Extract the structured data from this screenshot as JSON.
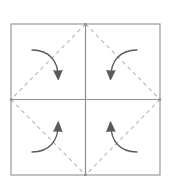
{
  "figure": {
    "name": "paper-folding-diagram",
    "title": "",
    "background_color": "#ffffff",
    "width": 172,
    "height": 185
  },
  "colors": {
    "square_outline": "#9a9a9a",
    "midline": "#8f8f8f",
    "dashed_diagonal": "#b5b5b5",
    "arrow": "#5a5a5a",
    "background": "#ffffff"
  },
  "square": {
    "name": "outer-square",
    "label": "",
    "left": 11,
    "top": 24,
    "right": 160,
    "bottom": 175,
    "stroke_width": 1.2
  },
  "midlines": {
    "horizontal": {
      "label": "",
      "x1": 11,
      "y1": 99.5,
      "x2": 160,
      "y2": 99.5
    },
    "vertical": {
      "label": "",
      "x1": 85.5,
      "y1": 24,
      "x2": 85.5,
      "y2": 175
    }
  },
  "diamond": {
    "name": "inscribed-diamond",
    "label": "",
    "dash_pattern": "4 3.5",
    "stroke_width": 1.1,
    "vertices": [
      {
        "name": "top-midpoint",
        "x": 85.5,
        "y": 24
      },
      {
        "name": "right-midpoint",
        "x": 160,
        "y": 99.5
      },
      {
        "name": "bottom-midpoint",
        "x": 85.5,
        "y": 175
      },
      {
        "name": "left-midpoint",
        "x": 11,
        "y": 99.5
      }
    ]
  },
  "arrows": [
    {
      "name": "arrow-top-left",
      "label": "",
      "quadrant": "top-left",
      "direction": "down-right",
      "path": "M 32,50 C 50,50 58,62 58,76",
      "head": {
        "x": 58,
        "y": 79,
        "angle": 100
      }
    },
    {
      "name": "arrow-top-right",
      "label": "",
      "quadrant": "top-right",
      "direction": "down-left",
      "path": "M 137,50 C 119,50 111,62 111,76",
      "head": {
        "x": 111,
        "y": 79,
        "angle": 80
      }
    },
    {
      "name": "arrow-bottom-left",
      "label": "",
      "quadrant": "bottom-left",
      "direction": "up-right",
      "path": "M 32,152 C 50,152 58,140 58,126",
      "head": {
        "x": 58,
        "y": 122,
        "angle": -80
      }
    },
    {
      "name": "arrow-bottom-right",
      "label": "",
      "quadrant": "bottom-right",
      "direction": "up-left",
      "path": "M 137,152 C 119,152 111,140 111,126",
      "head": {
        "x": 111,
        "y": 122,
        "angle": -100
      }
    }
  ]
}
